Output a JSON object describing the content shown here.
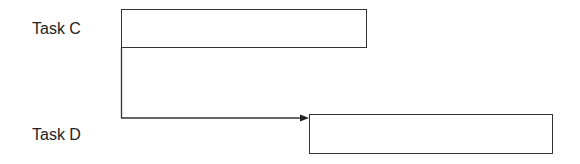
{
  "diagram": {
    "type": "gantt-dependency",
    "tasks": [
      {
        "label": "Task C",
        "bar": {
          "x": 121,
          "y": 9,
          "w": 246,
          "h": 39
        }
      },
      {
        "label": "Task D",
        "bar": {
          "x": 309,
          "y": 114,
          "w": 244,
          "h": 40
        }
      }
    ],
    "dependency": {
      "from": "Task C",
      "to": "Task D",
      "style": "finish-to-start arrow"
    },
    "colors": {
      "line": "#333333",
      "text": "#222222",
      "background": "#ffffff"
    }
  }
}
